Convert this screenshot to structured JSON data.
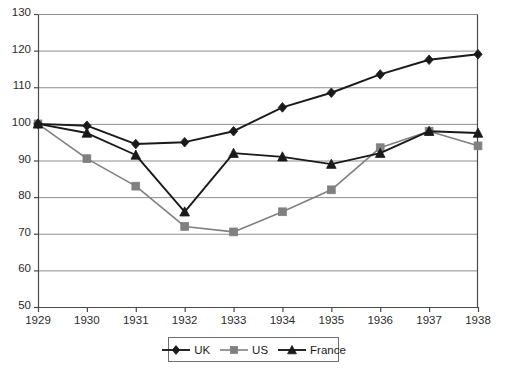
{
  "chart_data": {
    "type": "line",
    "title": "",
    "xlabel": "",
    "ylabel": "",
    "categories": [
      "1929",
      "1930",
      "1931",
      "1932",
      "1933",
      "1934",
      "1935",
      "1936",
      "1937",
      "1938"
    ],
    "x": [
      1929,
      1930,
      1931,
      1932,
      1933,
      1934,
      1935,
      1936,
      1937,
      1938
    ],
    "series": [
      {
        "name": "UK",
        "marker": "diamond",
        "color": "#1a1a1a",
        "values": [
          100,
          99.5,
          94.5,
          95,
          98,
          104.5,
          108.5,
          113.5,
          117.5,
          119
        ]
      },
      {
        "name": "US",
        "marker": "square",
        "color": "#808080",
        "values": [
          100,
          90.5,
          83,
          72,
          70.5,
          76,
          82,
          93.5,
          98,
          94
        ]
      },
      {
        "name": "France",
        "marker": "triangle",
        "color": "#1a1a1a",
        "values": [
          100,
          97.5,
          91.5,
          76,
          92,
          91,
          89,
          92,
          98,
          97.5
        ]
      }
    ],
    "ylim": [
      50,
      130
    ],
    "yticks": [
      50,
      60,
      70,
      80,
      90,
      100,
      110,
      120,
      130
    ],
    "xlim": [
      1929,
      1938
    ],
    "grid": "horizontal",
    "legend_position": "bottom-center",
    "legend_entries": [
      "UK",
      "US",
      "France"
    ]
  },
  "axis": {
    "y_tick_labels": [
      "130",
      "120",
      "110",
      "100",
      "90",
      "80",
      "70",
      "60",
      "50"
    ],
    "x_tick_labels": [
      "1929",
      "1930",
      "1931",
      "1932",
      "1933",
      "1934",
      "1935",
      "1936",
      "1937",
      "1938"
    ]
  },
  "colors": {
    "gridline": "#8c8c8c",
    "axis": "#4a4a4a",
    "series_uk": "#1a1a1a",
    "series_us": "#808080",
    "series_france": "#1a1a1a",
    "text": "#2b2b2b",
    "legend_border": "#6e6e6e",
    "background": "#ffffff"
  }
}
